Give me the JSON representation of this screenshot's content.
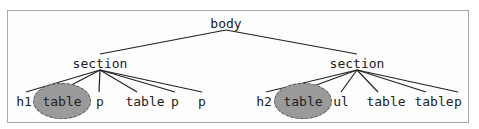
{
  "diagram": {
    "type": "tree",
    "colors": {
      "edge": "#222222",
      "highlight_fill": "#9a9a9a",
      "highlight_border": "#555555",
      "frame": "#a8a8a8"
    },
    "root": {
      "label": "body"
    },
    "sections": [
      {
        "label": "section",
        "children": [
          {
            "label": "h1",
            "highlighted": false
          },
          {
            "label": "table",
            "highlighted": true
          },
          {
            "label": "p",
            "highlighted": false
          },
          {
            "label": "table",
            "highlighted": false
          },
          {
            "label": "p",
            "highlighted": false
          },
          {
            "label": "p",
            "highlighted": false
          }
        ]
      },
      {
        "label": "section",
        "children": [
          {
            "label": "h2",
            "highlighted": false
          },
          {
            "label": "table",
            "highlighted": true
          },
          {
            "label": "ul",
            "highlighted": false
          },
          {
            "label": "table",
            "highlighted": false
          },
          {
            "label": "table",
            "highlighted": false
          },
          {
            "label": "p",
            "highlighted": false
          }
        ]
      }
    ]
  }
}
